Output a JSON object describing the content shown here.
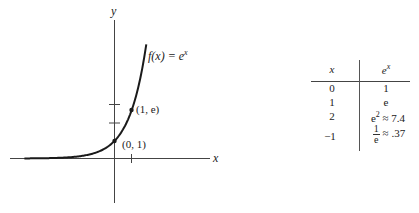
{
  "chart_data": {
    "type": "line",
    "title": "",
    "function_label": "f(x) = e^x",
    "xlabel": "x",
    "ylabel": "y",
    "xlim": [
      -5.3,
      5.5
    ],
    "ylim": [
      -2.5,
      8.8
    ],
    "grid": false,
    "x_ticks": [
      1
    ],
    "y_ticks": [
      1,
      2,
      3
    ],
    "highlighted_points": [
      {
        "x": 0,
        "y": 1,
        "label": "(0, 1)"
      },
      {
        "x": 1,
        "y": 2.718,
        "label": "(1, e)"
      }
    ],
    "series": [
      {
        "name": "f(x) = e^x",
        "x": [
          -5.3,
          -4,
          -3,
          -2,
          -1.5,
          -1,
          -0.5,
          0,
          0.5,
          1,
          1.25,
          1.5,
          1.75,
          1.87
        ],
        "y": [
          0.005,
          0.018,
          0.05,
          0.135,
          0.223,
          0.368,
          0.607,
          1,
          1.649,
          2.718,
          3.49,
          4.48,
          5.75,
          6.49
        ]
      }
    ],
    "table": {
      "columns": [
        "x",
        "e^x"
      ],
      "rows": [
        [
          "0",
          "1"
        ],
        [
          "1",
          "e"
        ],
        [
          "2",
          "e² ≈ 7.4"
        ],
        [
          "−1",
          "1/e ≈ .37"
        ]
      ]
    }
  },
  "graph": {
    "y_axis_label": "y",
    "x_axis_label": "x",
    "function_label_prefix": "f(x) = e",
    "function_label_exp": "x",
    "point_a_label": "(0, 1)",
    "point_b_label": "(1, e)"
  },
  "table": {
    "header_x": "x",
    "header_ex_base": "e",
    "header_ex_exp": "x",
    "rows": [
      {
        "x": "0",
        "val": "1"
      },
      {
        "x": "1",
        "val": "e"
      },
      {
        "x": "2",
        "val_base": "e",
        "val_exp": "2",
        "val_approx": " ≈ 7.4"
      },
      {
        "x": "−1",
        "frac_num": "1",
        "frac_den": "e",
        "val_approx": " ≈ .37"
      }
    ]
  },
  "colors": {
    "curve": "#1a1a1a",
    "axes": "#333333",
    "background": "#ffffff"
  }
}
